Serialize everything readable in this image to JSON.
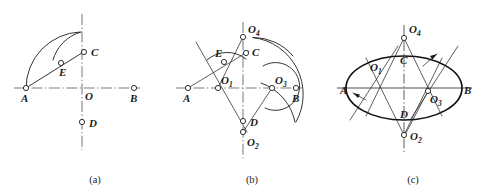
{
  "figure": {
    "background_color": "#ffffff",
    "line_color": "#1c1c1c",
    "centerline_color": "#7d7d7d",
    "width": 482,
    "height": 195
  },
  "panels": [
    {
      "id": "a",
      "caption": "(a)",
      "caption_x": 95,
      "caption_y": 183,
      "description": "Step 1: lay out major axis AB, minor axis CD, swing arc OA to locate point on CO extended, then arc from C through E",
      "axes": {
        "horizontal": {
          "x1": 14,
          "y1": 88,
          "x2": 140,
          "y2": 88,
          "label_left": "A",
          "label_right": "B"
        },
        "vertical": {
          "x1": 82,
          "y1": 14,
          "x2": 82,
          "y2": 150
        }
      },
      "points": [
        {
          "name": "A",
          "x": 26,
          "y": 88,
          "label": "A",
          "label_dx": -4,
          "label_dy": 13,
          "sub": ""
        },
        {
          "name": "B",
          "x": 134,
          "y": 88,
          "label": "B",
          "label_dx": -3,
          "label_dy": 13,
          "sub": ""
        },
        {
          "name": "C",
          "x": 83,
          "y": 53,
          "label": "C",
          "label_dx": 7,
          "label_dy": 3,
          "sub": ""
        },
        {
          "name": "D",
          "x": 82,
          "y": 122,
          "label": "D",
          "label_dx": 7,
          "label_dy": 4,
          "sub": ""
        },
        {
          "name": "E",
          "x": 62,
          "y": 62,
          "label": "E",
          "label_dx": -1,
          "label_dy": 13,
          "sub": ""
        },
        {
          "name": "O",
          "x": 82,
          "y": 88,
          "label": "O",
          "label_dx": 3,
          "label_dy": 12,
          "sub": "",
          "hide_node": true
        }
      ],
      "arcs": [
        {
          "name": "arc-OA-swing",
          "center_x": 82,
          "center_y": 88,
          "radius": 56,
          "start_deg": 180,
          "end_deg": 268
        },
        {
          "name": "arc-C-through-E",
          "center_x": 26,
          "center_y": 88,
          "radius": 40,
          "start_deg": 227,
          "end_deg": 270
        }
      ],
      "lines": [
        {
          "name": "line-A-to-C",
          "x1": 26,
          "y1": 88,
          "x2": 86,
          "y2": 50
        }
      ]
    },
    {
      "id": "b",
      "caption": "(b)",
      "caption_x": 252,
      "caption_y": 183,
      "description": "Step 2: bisect AE to locate centers O1, O3 on major axis and O2, O4 on minor axis; draw the four tangent arcs",
      "axes": {
        "horizontal": {
          "x1": 176,
          "y1": 88,
          "x2": 302,
          "y2": 88,
          "label_left": "A",
          "label_right": "B"
        },
        "vertical": {
          "x1": 243,
          "y1": 22,
          "x2": 243,
          "y2": 158
        }
      },
      "points": [
        {
          "name": "A",
          "x": 188,
          "y": 88,
          "label": "A",
          "label_dx": -4,
          "label_dy": 13,
          "sub": ""
        },
        {
          "name": "B",
          "x": 296,
          "y": 88,
          "label": "B",
          "label_dx": -3,
          "label_dy": 13,
          "sub": ""
        },
        {
          "name": "C",
          "x": 245,
          "y": 54,
          "label": "C",
          "label_dx": 7,
          "label_dy": 3,
          "sub": ""
        },
        {
          "name": "D",
          "x": 243,
          "y": 121,
          "label": "D",
          "label_dx": 7,
          "label_dy": 4,
          "sub": ""
        },
        {
          "name": "E",
          "x": 224,
          "y": 62,
          "label": "E",
          "label_dx": -9,
          "label_dy": -3,
          "sub": ""
        },
        {
          "name": "O1",
          "x": 218,
          "y": 88,
          "label": "O",
          "sub": "1",
          "label_dx": 3,
          "label_dy": -4
        },
        {
          "name": "O3",
          "x": 272,
          "y": 88,
          "label": "O",
          "sub": "3",
          "label_dx": 3,
          "label_dy": -4
        },
        {
          "name": "O4",
          "x": 243,
          "y": 37,
          "label": "O",
          "sub": "4",
          "label_dx": 5,
          "label_dy": -4
        },
        {
          "name": "O2",
          "x": 243,
          "y": 132,
          "label": "O",
          "sub": "2",
          "label_dx": 4,
          "label_dy": 14
        }
      ],
      "arcs": [
        {
          "name": "arc-upper-O4",
          "center_x": 243,
          "center_y": 37,
          "radius": 51,
          "start_deg": 12,
          "end_deg": 68
        },
        {
          "name": "arc-right-O3",
          "center_x": 272,
          "center_y": 88,
          "radius": 24,
          "start_deg": 295,
          "end_deg": 65
        },
        {
          "name": "arc-left-O1",
          "center_x": 218,
          "center_y": 88,
          "radius": 30,
          "start_deg": 248,
          "end_deg": 300
        },
        {
          "name": "arc-lower-O2",
          "center_x": 243,
          "center_y": 132,
          "radius": 52,
          "start_deg": 290,
          "end_deg": 350
        }
      ],
      "lines": [
        {
          "name": "line-bisector-through-O1",
          "x1": 196,
          "y1": 42,
          "x2": 248,
          "y2": 134
        },
        {
          "name": "line-A-to-E-extended",
          "x1": 188,
          "y1": 88,
          "x2": 248,
          "y2": 52
        },
        {
          "name": "line-O4-to-O1",
          "x1": 243,
          "y1": 37,
          "x2": 218,
          "y2": 88
        },
        {
          "name": "line-O2-to-O3",
          "x1": 243,
          "y1": 132,
          "x2": 272,
          "y2": 88
        }
      ]
    },
    {
      "id": "c",
      "caption": "(c)",
      "caption_x": 413,
      "caption_y": 183,
      "description": "Step 3: completed four-center approximate ellipse with all four radii and tangent points marked",
      "axes": {
        "horizontal": {
          "x1": 337,
          "y1": 88,
          "x2": 472,
          "y2": 88,
          "label_left": "A",
          "label_right": "B"
        },
        "vertical": {
          "x1": 404,
          "y1": 25,
          "x2": 404,
          "y2": 152
        }
      },
      "ellipse": {
        "cx": 404,
        "cy": 88,
        "rx": 58,
        "ry": 32
      },
      "points": [
        {
          "name": "A",
          "x": 349,
          "y": 88,
          "label": "A",
          "label_dx": -10,
          "label_dy": 5,
          "hide_node": true
        },
        {
          "name": "B",
          "x": 461,
          "y": 88,
          "label": "B",
          "label_dx": 5,
          "label_dy": 5,
          "hide_node": true
        },
        {
          "name": "C",
          "x": 404,
          "y": 60,
          "label": "C",
          "label_dx": 3,
          "label_dy": 0,
          "hide_node": true
        },
        {
          "name": "D",
          "x": 404,
          "y": 114,
          "label": "D",
          "label_dx": 3,
          "label_dy": 2,
          "hide_node": true
        },
        {
          "name": "O1",
          "x": 383,
          "y": 88,
          "label": "O",
          "sub": "1",
          "label_dx": -9,
          "label_dy": -9,
          "hide_node": true
        },
        {
          "name": "O3",
          "x": 428,
          "y": 91,
          "label": "O",
          "sub": "3",
          "label_dx": 2,
          "label_dy": 12
        },
        {
          "name": "O4",
          "x": 404,
          "y": 38,
          "label": "O",
          "sub": "4",
          "label_dx": 5,
          "label_dy": -5
        },
        {
          "name": "O2",
          "x": 404,
          "y": 135,
          "label": "O",
          "sub": "2",
          "label_dx": 5,
          "label_dy": 5
        }
      ],
      "lines": [
        {
          "name": "radius-line-O4-left",
          "x1": 404,
          "y1": 38,
          "x2": 368,
          "y2": 112
        },
        {
          "name": "radius-line-O4-right",
          "x1": 404,
          "y1": 38,
          "x2": 440,
          "y2": 112
        },
        {
          "name": "radius-line-O2-left",
          "x1": 404,
          "y1": 135,
          "x2": 368,
          "y2": 62
        },
        {
          "name": "radius-line-O2-right",
          "x1": 404,
          "y1": 135,
          "x2": 440,
          "y2": 62
        },
        {
          "name": "tangent-line-left",
          "x1": 352,
          "y1": 118,
          "x2": 396,
          "y2": 50
        },
        {
          "name": "tangent-line-right",
          "x1": 412,
          "y1": 118,
          "x2": 456,
          "y2": 50
        },
        {
          "name": "leader-O3-to-O2",
          "x1": 428,
          "y1": 91,
          "x2": 406,
          "y2": 133
        }
      ],
      "arrows": [
        {
          "name": "arrow-left-radius",
          "x1": 364,
          "y1": 100,
          "x2": 352,
          "y2": 92
        },
        {
          "name": "arrow-right-radius",
          "x1": 424,
          "y1": 64,
          "x2": 437,
          "y2": 54
        }
      ]
    }
  ]
}
